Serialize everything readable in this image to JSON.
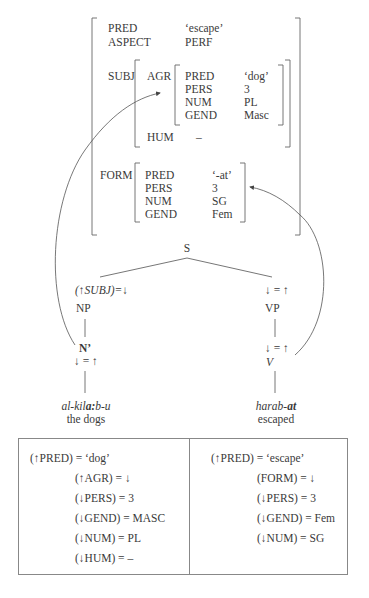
{
  "fstructure": {
    "pred": {
      "attr": "PRED",
      "value": "‘escape’"
    },
    "aspect": {
      "attr": "ASPECT",
      "value": "PERF"
    },
    "subj": {
      "attr": "SUBJ",
      "agr": {
        "attr": "AGR",
        "rows": [
          {
            "attr": "PRED",
            "value": "‘dog’"
          },
          {
            "attr": "PERS",
            "value": "3"
          },
          {
            "attr": "NUM",
            "value": "PL"
          },
          {
            "attr": "GEND",
            "value": "Masc"
          }
        ]
      },
      "hum": {
        "attr": "HUM",
        "value": "–"
      }
    },
    "form": {
      "attr": "FORM",
      "rows": [
        {
          "attr": "PRED",
          "value": "‘-at’"
        },
        {
          "attr": "PERS",
          "value": "3"
        },
        {
          "attr": "NUM",
          "value": "SG"
        },
        {
          "attr": "GEND",
          "value": "Fem"
        }
      ]
    }
  },
  "tree": {
    "root": "S",
    "left": {
      "annotation": "(↑SUBJ)=↓",
      "np": "NP",
      "nbar": "N’",
      "nbar_annotation": "↓ = ↑",
      "word_pre": "al-kil",
      "word_bold": "a:",
      "word_post": "b-u",
      "gloss": "the dogs"
    },
    "right": {
      "annotation": "↓ = ↑",
      "vp": "VP",
      "v_annotation": "↓ = ↑",
      "v": "V",
      "word_pre": "harab-",
      "word_bold": "at",
      "gloss": "escaped"
    }
  },
  "lexicon": {
    "noun": {
      "head": "(↑PRED) = ‘dog’",
      "equations": [
        "(↑AGR) = ↓",
        "(↓PERS) = 3",
        "(↓GEND) = MASC",
        "(↓NUM) = PL",
        "(↓HUM) = –"
      ]
    },
    "verb": {
      "head": "(↑PRED) = ‘escape’",
      "equations": [
        "(FORM) = ↓",
        "(↓PERS) = 3",
        "(↓GEND) = Fem",
        "(↓NUM) = SG"
      ]
    }
  }
}
